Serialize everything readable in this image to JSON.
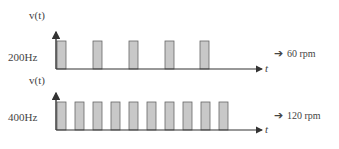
{
  "diagram": {
    "rows": [
      {
        "freq_label": "200Hz",
        "y_axis_label": "v(t)",
        "x_axis_label": "t",
        "result_arrow": "➔",
        "result_label": "60 rpm",
        "pulse_count": 5
      },
      {
        "freq_label": "400Hz",
        "y_axis_label": "v(t)",
        "x_axis_label": "t",
        "result_arrow": "➔",
        "result_label": "120 rpm",
        "pulse_count": 10
      }
    ],
    "colors": {
      "pulse_fill": "#c8c8c8",
      "pulse_stroke": "#666666",
      "axis": "#333333"
    }
  }
}
